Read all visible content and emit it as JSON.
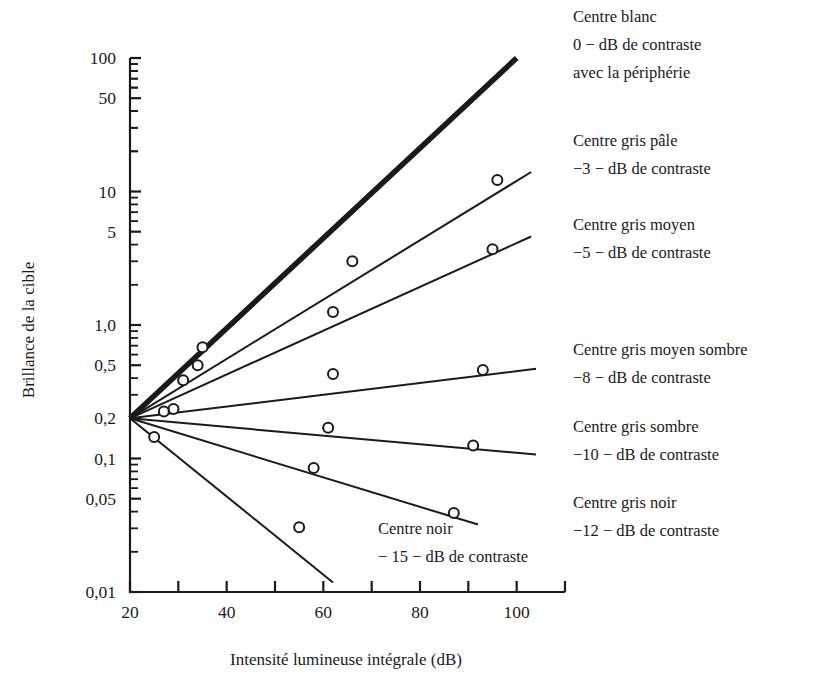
{
  "chart_data": {
    "type": "line",
    "title": "",
    "xlabel": "Intensité lumineuse intégrale (dB)",
    "ylabel": "Brillance de la cible",
    "xlim": [
      20,
      110
    ],
    "ylim": [
      0.01,
      100
    ],
    "yscale": "log",
    "grid": false,
    "legend_position": "right-inline-annotations",
    "xticks": [
      20,
      40,
      60,
      80,
      100
    ],
    "xticklabels": [
      "20",
      "40",
      "60",
      "80",
      "100"
    ],
    "xminorticks": [
      30,
      50,
      70,
      90,
      110
    ],
    "yticks": [
      100,
      50,
      10,
      5,
      1.0,
      0.5,
      0.2,
      0.1,
      0.05,
      0.01
    ],
    "yticklabels": [
      "100",
      "50",
      "10",
      "5",
      "1,0",
      "0,5",
      "0,2",
      "0,1",
      "0,05",
      "0,01"
    ],
    "origin": {
      "x": 20,
      "y": 0.2
    },
    "series": [
      {
        "name": "Centre blanc",
        "contrast_db": "0",
        "label_lines": [
          "Centre blanc",
          "0 − dB de contraste",
          "avec la périphérie"
        ],
        "linewidth": 5.5,
        "x": [
          20,
          100
        ],
        "y": [
          0.2,
          100
        ],
        "markers_x": [],
        "markers_y": [],
        "label_x": 573,
        "label_y": 22
      },
      {
        "name": "Centre gris pâle",
        "contrast_db": "-3",
        "label_lines": [
          "Centre gris pâle",
          "−3 − dB de contraste"
        ],
        "linewidth": 2.0,
        "x": [
          20,
          103
        ],
        "y": [
          0.2,
          14.0
        ],
        "markers_x": [
          35,
          66,
          96
        ],
        "markers_y": [
          0.68,
          3.0,
          12.2
        ],
        "label_x": 573,
        "label_y": 146
      },
      {
        "name": "Centre gris moyen",
        "contrast_db": "-5",
        "label_lines": [
          "Centre gris moyen",
          "−5 − dB de contraste"
        ],
        "linewidth": 2.0,
        "x": [
          20,
          103
        ],
        "y": [
          0.2,
          4.6
        ],
        "markers_x": [
          34,
          62,
          95
        ],
        "markers_y": [
          0.5,
          1.25,
          3.7
        ],
        "label_x": 573,
        "label_y": 230
      },
      {
        "name": "Centre gris moyen sombre",
        "contrast_db": "-8",
        "label_lines": [
          "Centre gris moyen sombre",
          "−8 − dB de contraste"
        ],
        "linewidth": 2.0,
        "x": [
          20,
          104
        ],
        "y": [
          0.2,
          0.47
        ],
        "markers_x": [
          31,
          62,
          93
        ],
        "markers_y": [
          0.385,
          0.43,
          0.46
        ],
        "label_x": 573,
        "label_y": 355
      },
      {
        "name": "Centre gris sombre",
        "contrast_db": "-10",
        "label_lines": [
          "Centre gris sombre",
          "−10 − dB de contraste"
        ],
        "linewidth": 2.0,
        "x": [
          20,
          104
        ],
        "y": [
          0.2,
          0.107
        ],
        "markers_x": [
          29,
          61,
          91
        ],
        "markers_y": [
          0.235,
          0.17,
          0.125
        ],
        "label_x": 573,
        "label_y": 432
      },
      {
        "name": "Centre gris noir",
        "contrast_db": "-12",
        "label_lines": [
          "Centre gris noir",
          "−12 − dB de contraste"
        ],
        "linewidth": 2.0,
        "x": [
          20,
          92
        ],
        "y": [
          0.2,
          0.032
        ],
        "markers_x": [
          27,
          58,
          87
        ],
        "markers_y": [
          0.225,
          0.085,
          0.039
        ],
        "label_x": 573,
        "label_y": 508
      },
      {
        "name": "Centre noir",
        "contrast_db": "-15",
        "label_lines": [
          "Centre noir",
          "− 15 − dB de contraste"
        ],
        "linewidth": 2.0,
        "x": [
          20,
          62
        ],
        "y": [
          0.2,
          0.0118
        ],
        "markers_x": [
          25,
          55
        ],
        "markers_y": [
          0.145,
          0.0305
        ],
        "label_x": 378,
        "label_y": 534
      }
    ]
  },
  "figure": {
    "xaxis_title": "Intensité lumineuse intégrale (dB)",
    "yaxis_title": "Brillance de la cible"
  }
}
